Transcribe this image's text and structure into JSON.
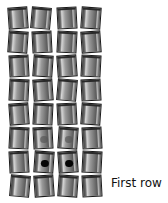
{
  "figure": {
    "label": "First row",
    "rows": [
      {
        "index": 8,
        "y": 7,
        "tiles": [
          {
            "x": 8,
            "rot": -4,
            "mark": "none"
          },
          {
            "x": 31,
            "rot": 5,
            "mark": "none"
          },
          {
            "x": 57,
            "rot": -3,
            "mark": "none"
          },
          {
            "x": 81,
            "rot": 4,
            "mark": "none"
          }
        ]
      },
      {
        "index": 7,
        "y": 33,
        "tiles": [
          {
            "x": 8,
            "rot": 4,
            "mark": "none"
          },
          {
            "x": 32,
            "rot": -3,
            "mark": "none"
          },
          {
            "x": 57,
            "rot": 3,
            "mark": "none"
          },
          {
            "x": 81,
            "rot": -4,
            "mark": "none"
          }
        ]
      },
      {
        "index": 6,
        "y": 58,
        "tiles": [
          {
            "x": 9,
            "rot": -3,
            "mark": "none"
          },
          {
            "x": 33,
            "rot": 4,
            "mark": "none"
          },
          {
            "x": 57,
            "rot": -4,
            "mark": "none"
          },
          {
            "x": 81,
            "rot": 3,
            "mark": "none"
          }
        ]
      },
      {
        "index": 5,
        "y": 84,
        "tiles": [
          {
            "x": 9,
            "rot": 3,
            "mark": "none"
          },
          {
            "x": 33,
            "rot": -4,
            "mark": "none"
          },
          {
            "x": 57,
            "rot": 5,
            "mark": "none"
          },
          {
            "x": 81,
            "rot": -3,
            "mark": "none"
          }
        ]
      },
      {
        "index": 4,
        "y": 109,
        "tiles": [
          {
            "x": 9,
            "rot": -4,
            "mark": "none"
          },
          {
            "x": 33,
            "rot": 3,
            "mark": "none"
          },
          {
            "x": 57,
            "rot": -3,
            "mark": "none"
          },
          {
            "x": 81,
            "rot": 4,
            "mark": "none"
          }
        ]
      },
      {
        "index": 3,
        "y": 134,
        "tiles": [
          {
            "x": 9,
            "rot": 3,
            "mark": "none"
          },
          {
            "x": 33,
            "rot": -3,
            "mark": "faint"
          },
          {
            "x": 58,
            "rot": 4,
            "mark": "faint"
          },
          {
            "x": 82,
            "rot": -3,
            "mark": "none"
          }
        ]
      },
      {
        "index": 2,
        "y": 150,
        "tiles": [
          {
            "x": 9,
            "rot": -3,
            "mark": "none"
          },
          {
            "x": 34,
            "rot": 4,
            "mark": "solid"
          },
          {
            "x": 58,
            "rot": -4,
            "mark": "solid"
          },
          {
            "x": 82,
            "rot": 3,
            "mark": "none"
          }
        ]
      },
      {
        "index": 1,
        "y": 175,
        "tiles": [
          {
            "x": 10,
            "rot": 5,
            "mark": "none"
          },
          {
            "x": 34,
            "rot": -4,
            "mark": "none"
          },
          {
            "x": 58,
            "rot": 4,
            "mark": "none"
          },
          {
            "x": 82,
            "rot": -3,
            "mark": "none"
          }
        ]
      }
    ]
  }
}
